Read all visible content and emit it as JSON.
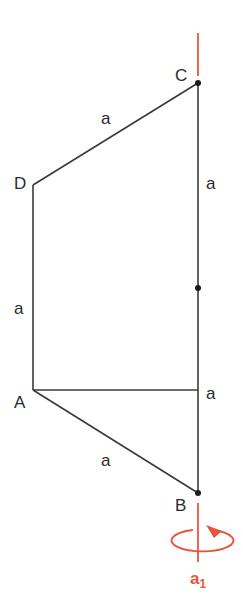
{
  "diagram": {
    "colors": {
      "edge": "#3a3a3a",
      "axis": "#e8553a",
      "text": "#2a2a2a"
    },
    "vertices": {
      "C": {
        "label": "C",
        "x": 198,
        "y": 83
      },
      "D": {
        "label": "D",
        "x": 33,
        "y": 185
      },
      "A": {
        "label": "A",
        "x": 33,
        "y": 390
      },
      "B": {
        "label": "B",
        "x": 198,
        "y": 493
      },
      "M": {
        "label": "",
        "x": 198,
        "y": 288
      }
    },
    "edges": [
      {
        "from": "C",
        "to": "D",
        "label": "a"
      },
      {
        "from": "D",
        "to": "A",
        "label": "a"
      },
      {
        "from": "A",
        "to": "B",
        "label": "a"
      },
      {
        "from": "C",
        "to": "M",
        "label": "a"
      },
      {
        "from": "M",
        "to": "B",
        "label": "a"
      },
      {
        "from": "A",
        "to": "axis",
        "label": ""
      }
    ],
    "labels": {
      "C": "C",
      "D": "D",
      "A": "A",
      "B": "B",
      "edge_CD": "a",
      "edge_CM": "a",
      "edge_DA": "a",
      "edge_MB": "a",
      "edge_AB": "a"
    },
    "rotation_axis": {
      "name": "a",
      "subscript": "1",
      "direction": "counterclockwise-arrow-top-right"
    }
  }
}
